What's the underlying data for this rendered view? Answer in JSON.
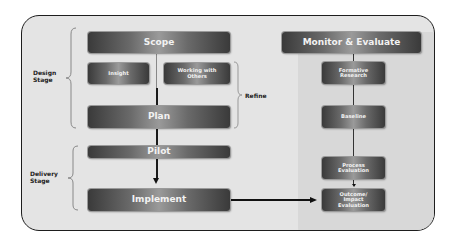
{
  "diagram": {
    "left": {
      "scope": "Scope",
      "insight": "Insight",
      "working_with_others": "Working with Others",
      "plan": "Plan",
      "pilot": "Pilot",
      "implement": "Implement"
    },
    "stage_labels": {
      "design": "Design Stage",
      "delivery": "Delivery Stage",
      "refine": "Refine"
    },
    "right": {
      "header": "Monitor & Evaluate",
      "formative_research": "Formative Research",
      "baseline": "Baseline",
      "process_evaluation": "Process Evaluation",
      "outcome_impact_evaluation": "Outcome/ Impact Evaluation"
    },
    "colors": {
      "frame_border": "#1e1e1e",
      "background": "#e4e4e4",
      "box_dark": "#3a3a3a",
      "box_light": "#9a9a9a",
      "box_text": "#f2f2f2",
      "connector": "#111111"
    }
  }
}
